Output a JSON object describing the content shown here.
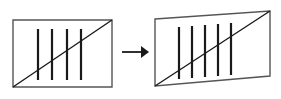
{
  "figure": {
    "title": "Geometric transformation diagram",
    "background_color": "#ffffff",
    "stroke_color": "#1a1a1a",
    "outline_color": "#555555",
    "panels": [
      {
        "id": "source-shape",
        "label": "rectangle",
        "shape_type": "rectangle",
        "outline_points": "13,20 112,20 112,87 13,87",
        "outline_width": 1.4,
        "diagonal": {
          "label": "diagonal",
          "points": "13,87 112,20",
          "width": 1.4
        },
        "vertical_lines": [
          {
            "label": "tally-1",
            "x": 38,
            "y1": 29,
            "y2": 80,
            "width": 2.2
          },
          {
            "label": "tally-2",
            "x": 52,
            "y1": 29,
            "y2": 80,
            "width": 2.2
          },
          {
            "label": "tally-3",
            "x": 67,
            "y1": 29,
            "y2": 80,
            "width": 2.2
          },
          {
            "label": "tally-4",
            "x": 81,
            "y1": 29,
            "y2": 80,
            "width": 2.2
          }
        ],
        "vertical_line_count": 4
      },
      {
        "id": "target-shape",
        "label": "sheared quadrilateral",
        "shape_type": "quadrilateral",
        "outline_points": "155,19 270,11 270,76 155,86",
        "outline_width": 1.4,
        "diagonal": {
          "label": "diagonal",
          "points": "155,86 270,11",
          "width": 1.4
        },
        "vertical_lines": [
          {
            "label": "tally-1",
            "x": 179,
            "y1": 27,
            "y2": 79,
            "width": 2.2
          },
          {
            "label": "tally-2",
            "x": 192,
            "y1": 26,
            "y2": 78,
            "width": 2.2
          },
          {
            "label": "tally-3",
            "x": 205,
            "y1": 25,
            "y2": 77,
            "width": 2.2
          },
          {
            "label": "tally-4",
            "x": 218,
            "y1": 24,
            "y2": 76,
            "width": 2.2
          },
          {
            "label": "tally-5",
            "x": 231,
            "y1": 23,
            "y2": 75,
            "width": 2.2
          }
        ],
        "vertical_line_count": 5
      }
    ],
    "arrow": {
      "label": "transformation arrow",
      "direction": "right",
      "shaft": {
        "x1": 122,
        "y1": 52,
        "x2": 141,
        "y2": 52,
        "width": 1.8
      },
      "head": "141,46 149,52 141,58"
    }
  }
}
